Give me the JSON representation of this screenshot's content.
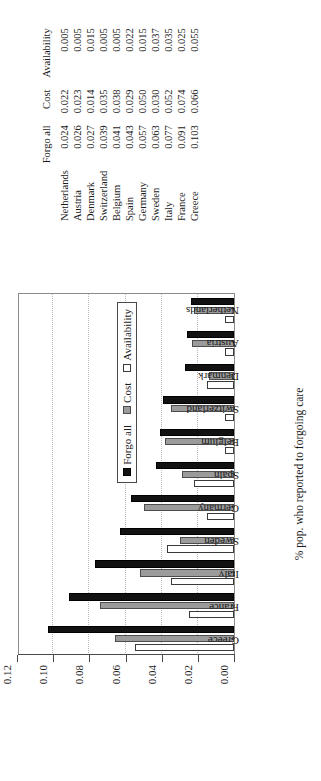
{
  "chart_data": {
    "type": "bar",
    "title": "",
    "xlabel": "% pop. who reported to forgoing care",
    "ylabel": "",
    "orientation": "vertical-printed-sideways",
    "grid": true,
    "legend_position": "inside-right",
    "ylim": [
      0.0,
      0.12
    ],
    "yticks": [
      "0.00",
      "0.02",
      "0.04",
      "0.06",
      "0.08",
      "0.10",
      "0.12"
    ],
    "ytick_values": [
      0.0,
      0.02,
      0.04,
      0.06,
      0.08,
      0.1,
      0.12
    ],
    "categories": [
      "Greece",
      "France",
      "Italy",
      "Sweden",
      "Germany",
      "Spain",
      "Belgium",
      "Switzerland",
      "Denmark",
      "Austria",
      "Netherlands"
    ],
    "series": [
      {
        "name": "Forgo all",
        "color": "#121212",
        "values": [
          0.103,
          0.091,
          0.077,
          0.063,
          0.057,
          0.043,
          0.041,
          0.039,
          0.027,
          0.026,
          0.024
        ]
      },
      {
        "name": "Cost",
        "color": "#9b9b9b",
        "values": [
          0.066,
          0.074,
          0.052,
          0.03,
          0.05,
          0.029,
          0.038,
          0.035,
          0.014,
          0.023,
          0.022
        ]
      },
      {
        "name": "Availability",
        "color": "#ffffff",
        "values": [
          0.055,
          0.025,
          0.035,
          0.037,
          0.015,
          0.022,
          0.005,
          0.005,
          0.015,
          0.005,
          0.005
        ]
      }
    ]
  },
  "legend": {
    "items": [
      {
        "label": "Forgo all",
        "swatch": "forgo"
      },
      {
        "label": "Cost",
        "swatch": "cost"
      },
      {
        "label": "Availability",
        "swatch": "avail"
      }
    ]
  },
  "table": {
    "headers": [
      "",
      "Forgo all",
      "Cost",
      "Availability"
    ],
    "rows": [
      {
        "country": "Netherlands",
        "forgo": "0.024",
        "cost": "0.022",
        "avail": "0.005"
      },
      {
        "country": "Austria",
        "forgo": "0.026",
        "cost": "0.023",
        "avail": "0.005"
      },
      {
        "country": "Denmark",
        "forgo": "0.027",
        "cost": "0.014",
        "avail": "0.015"
      },
      {
        "country": "Switzerland",
        "forgo": "0.039",
        "cost": "0.035",
        "avail": "0.005"
      },
      {
        "country": "Belgium",
        "forgo": "0.041",
        "cost": "0.038",
        "avail": "0.005"
      },
      {
        "country": "Spain",
        "forgo": "0.043",
        "cost": "0.029",
        "avail": "0.022"
      },
      {
        "country": "Germany",
        "forgo": "0.057",
        "cost": "0.050",
        "avail": "0.015"
      },
      {
        "country": "Sweden",
        "forgo": "0.063",
        "cost": "0.030",
        "avail": "0.037"
      },
      {
        "country": "Italy",
        "forgo": "0.077",
        "cost": "0.052",
        "avail": "0.035"
      },
      {
        "country": "France",
        "forgo": "0.091",
        "cost": "0.074",
        "avail": "0.025"
      },
      {
        "country": "Greece",
        "forgo": "0.103",
        "cost": "0.066",
        "avail": "0.055"
      }
    ]
  }
}
